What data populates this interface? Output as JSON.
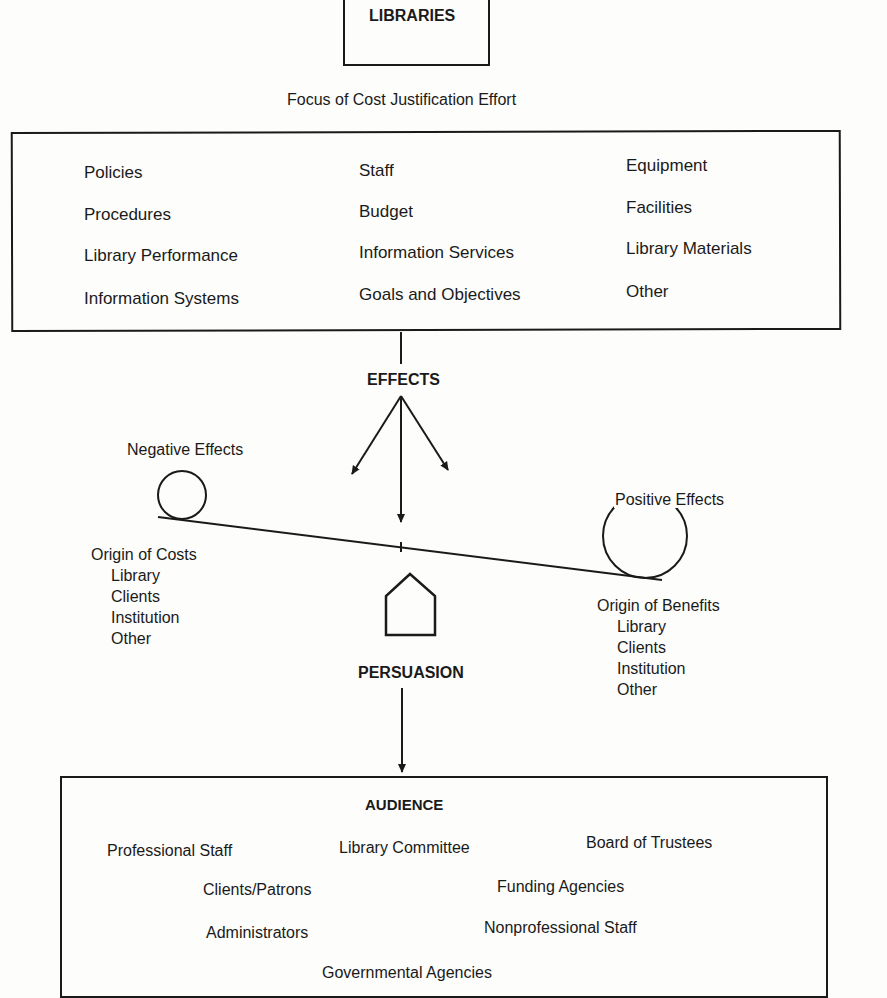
{
  "top": {
    "title": "LIBRARIES",
    "subtitle": "Focus of Cost Justification Effort"
  },
  "focus": {
    "columns": [
      [
        "Policies",
        "Procedures",
        "Library Performance",
        "Information Systems"
      ],
      [
        "Staff",
        "Budget",
        "Information Services",
        "Goals and Objectives"
      ],
      [
        "Equipment",
        "Facilities",
        "Library Materials",
        "Other"
      ]
    ]
  },
  "effects": {
    "label": "EFFECTS",
    "negative": {
      "label": "Negative Effects",
      "origin_title": "Origin of Costs",
      "origins": [
        "Library",
        "Clients",
        "Institution",
        "Other"
      ]
    },
    "positive": {
      "label": "Positive Effects",
      "origin_title": "Origin of Benefits",
      "origins": [
        "Library",
        "Clients",
        "Institution",
        "Other"
      ]
    }
  },
  "persuasion": {
    "label": "PERSUASION"
  },
  "audience": {
    "title": "AUDIENCE",
    "items": [
      "Professional Staff",
      "Library Committee",
      "Board of Trustees",
      "Clients/Patrons",
      "Funding Agencies",
      "Administrators",
      "Nonprofessional Staff",
      "Governmental Agencies"
    ]
  }
}
